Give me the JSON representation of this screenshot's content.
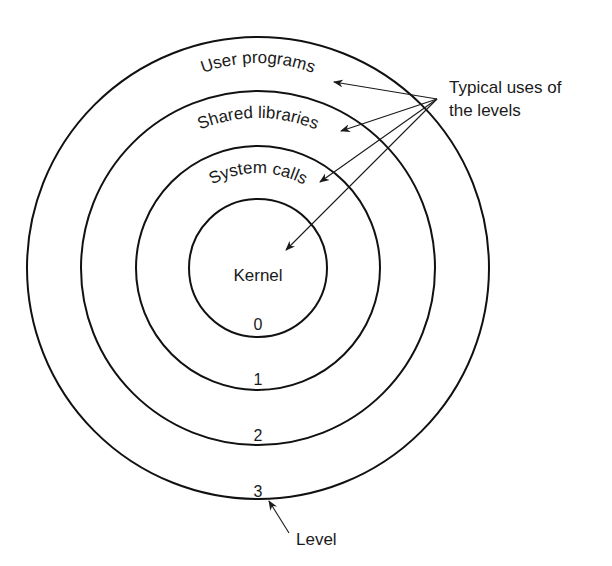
{
  "diagram": {
    "callout": {
      "line1": "Typical uses of",
      "line2": "the levels"
    },
    "rings": [
      {
        "level": "0",
        "use": "Kernel"
      },
      {
        "level": "1",
        "use": "System calls"
      },
      {
        "level": "2",
        "use": "Shared libraries"
      },
      {
        "level": "3",
        "use": "User programs"
      }
    ],
    "level_label": "Level",
    "colors": {
      "stroke": "#111111",
      "background": "#ffffff"
    }
  }
}
